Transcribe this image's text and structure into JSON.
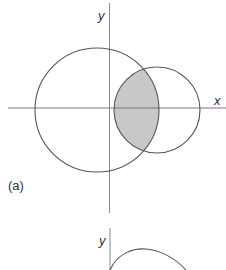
{
  "figure_a": {
    "axis_x_label": "x",
    "axis_y_label": "y",
    "caption": "(a)",
    "colors": {
      "stroke": "#555555",
      "shade": "#c8c8c8",
      "axis": "#777777"
    },
    "large_circle": {
      "cx": 97,
      "cy": 110,
      "r": 62
    },
    "small_circle": {
      "cx": 157,
      "cy": 110,
      "r": 43
    },
    "shaded_region": "intersection of the two circles"
  },
  "figure_b": {
    "axis_y_label": "y"
  }
}
